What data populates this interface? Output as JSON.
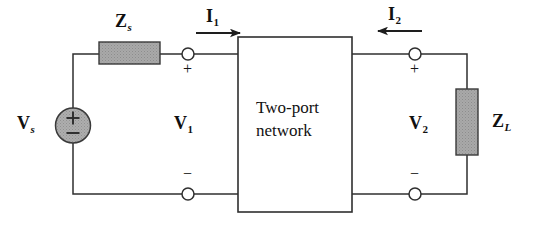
{
  "figure": {
    "type": "circuit-diagram",
    "background_color": "#ffffff",
    "line_color": "#2b2b2b",
    "component_fill": "#a8a8a8"
  },
  "labels": {
    "source_voltage": "V",
    "source_voltage_sub": "s",
    "source_impedance": "Z",
    "source_impedance_sub": "s",
    "load_impedance": "Z",
    "load_impedance_sub": "L",
    "port1_voltage": "V",
    "port1_voltage_sub": "1",
    "port2_voltage": "V",
    "port2_voltage_sub": "2",
    "port1_current": "I",
    "port1_current_sub": "1",
    "port2_current": "I",
    "port2_current_sub": "2",
    "network_line1": "Two-port",
    "network_line2": "network",
    "plus": "+",
    "minus": "−"
  },
  "polarity": {
    "port1_top": "+",
    "port1_bottom": "−",
    "port2_top": "+",
    "port2_bottom": "−",
    "source_top": "+",
    "source_bottom": "−"
  },
  "components": [
    {
      "name": "source-impedance-zs",
      "kind": "impedance-block",
      "orientation": "horizontal",
      "label": "Zs"
    },
    {
      "name": "voltage-source-vs",
      "kind": "independent-voltage-source",
      "orientation": "vertical",
      "label": "Vs"
    },
    {
      "name": "two-port-network",
      "kind": "black-box",
      "label": "Two-port network"
    },
    {
      "name": "load-impedance-zl",
      "kind": "impedance-block",
      "orientation": "vertical",
      "label": "ZL"
    }
  ],
  "currents": [
    {
      "name": "I1",
      "direction": "right",
      "location": "port-1-top"
    },
    {
      "name": "I2",
      "direction": "left",
      "location": "port-2-top"
    }
  ]
}
